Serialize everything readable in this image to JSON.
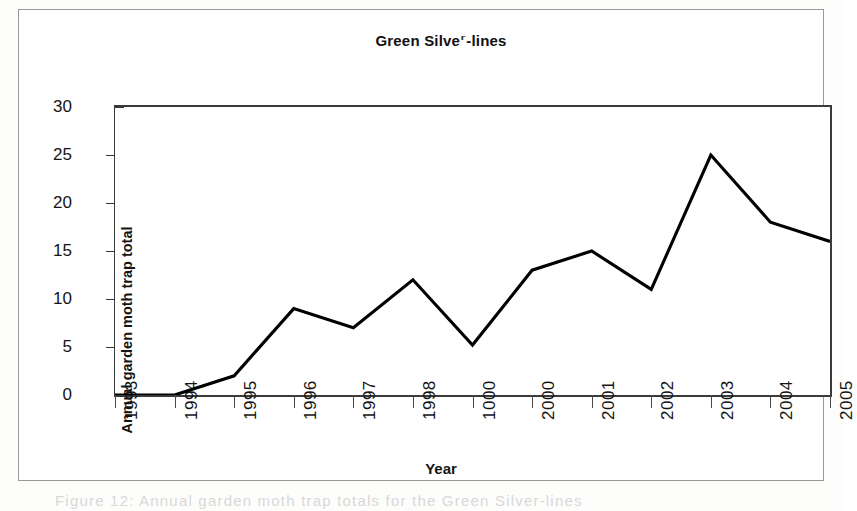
{
  "figure": {
    "title": "Green Silver-lines",
    "title_prefix": "Green Silve",
    "title_degraded_glyph": "r",
    "title_suffix": "-lines",
    "caption": "Figure 12: Annual garden moth trap totals for the Green Silver-lines",
    "frame_color": "#9a9a9a",
    "background": "#ffffff",
    "line_color": "#000000"
  },
  "chart_data": {
    "type": "line",
    "title": "Green Silver-lines",
    "xlabel": "Year",
    "ylabel": "Annual garden moth trap total",
    "categories": [
      "1993",
      "1994",
      "1995",
      "1996",
      "1997",
      "1998",
      "1000",
      "2000",
      "2001",
      "2002",
      "2003",
      "2004",
      "2005"
    ],
    "values": [
      0,
      0,
      2,
      9,
      7,
      12,
      5.2,
      13,
      15,
      11,
      25,
      18,
      16
    ],
    "ylim": [
      0,
      30
    ],
    "ytick_labels": [
      "0",
      "5",
      "10",
      "15",
      "20",
      "25",
      "30"
    ],
    "ytick_values": [
      0,
      5,
      10,
      15,
      20,
      25,
      30
    ],
    "grid": false,
    "legend": null,
    "markers": false,
    "series": [
      {
        "name": "Annual garden moth trap total",
        "values": [
          0,
          0,
          2,
          9,
          7,
          12,
          5.2,
          13,
          15,
          11,
          25,
          18,
          16
        ]
      }
    ]
  }
}
